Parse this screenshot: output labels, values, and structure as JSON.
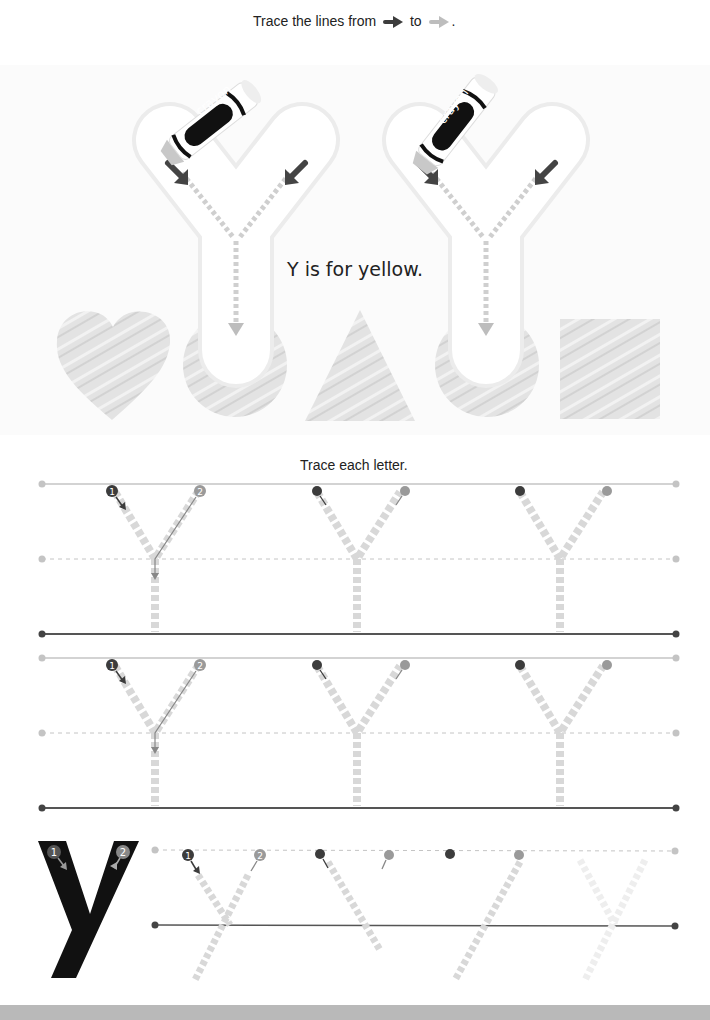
{
  "section1": {
    "instruction_prefix": "Trace the lines from",
    "instruction_mid": "to",
    "instruction_suffix": ".",
    "start_arrow_icon": "dark-arrow-right",
    "end_arrow_icon": "light-arrow-right",
    "caption": "Y is for yellow.",
    "crayon_label": "crayon",
    "crayon_label_2": "crayon",
    "shapes": [
      "heart",
      "circle",
      "triangle",
      "circle",
      "square"
    ]
  },
  "section2": {
    "instruction": "Trace each letter.",
    "rows": [
      {
        "letter": "Y",
        "guides": 3,
        "stroke_numbers": [
          "1",
          "2"
        ]
      },
      {
        "letter": "Y",
        "guides": 3,
        "stroke_numbers": [
          "1",
          "2"
        ]
      }
    ]
  },
  "section3": {
    "model_letter": "y",
    "stroke_numbers": [
      "1",
      "2"
    ],
    "guides": 4
  },
  "colors": {
    "dark": "#3c3c3c",
    "mid": "#9a9a9a",
    "light": "#cfcfcf",
    "shape_fill": "#e2e2e2",
    "footer": "#b9b9b9"
  }
}
